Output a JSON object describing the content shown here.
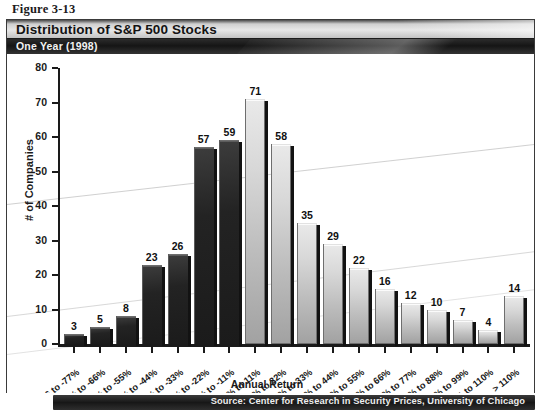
{
  "figure": {
    "caption": "Figure 3-13"
  },
  "banner": {
    "title": "Distribution of S&P 500 Stocks",
    "subtitle": "One Year (1998)"
  },
  "source": {
    "text": "Source: Center for Research in Security Prices, University of Chicago"
  },
  "chart_data": {
    "type": "bar",
    "title": "Distribution of S&P 500 Stocks",
    "subtitle": "One Year (1998)",
    "xlabel": "Annual Return",
    "ylabel": "# of Companies",
    "ylim": [
      0,
      80
    ],
    "yticks": [
      0,
      10,
      20,
      30,
      40,
      50,
      60,
      70,
      80
    ],
    "grid": false,
    "legend": null,
    "categories": [
      "-66 to -77%",
      "-55% to -66%",
      "-44% to -55%",
      "-33% to -44%",
      "-22% to -33%",
      "-11% to -22%",
      "0% to -11%",
      "0% to 11%",
      "11% to 22%",
      "22% to 33%",
      "33% to 44%",
      "44% to 55%",
      "55% to 66%",
      "66% to 77%",
      "77% to 88%",
      "88% to 99%",
      "99% to 110%",
      "> 110%"
    ],
    "values": [
      3,
      5,
      8,
      23,
      26,
      57,
      59,
      71,
      58,
      35,
      29,
      22,
      16,
      12,
      10,
      7,
      4,
      14
    ],
    "bar_styles": [
      "dark",
      "dark",
      "dark",
      "dark",
      "dark",
      "dark",
      "dark",
      "light",
      "light",
      "light",
      "light",
      "light",
      "light",
      "light",
      "light",
      "light",
      "light",
      "light"
    ],
    "colors": {
      "dark_bar": "#222222",
      "light_bar": "#c8c8c8",
      "axis": "#1a1a1a",
      "text": "#101010"
    }
  }
}
